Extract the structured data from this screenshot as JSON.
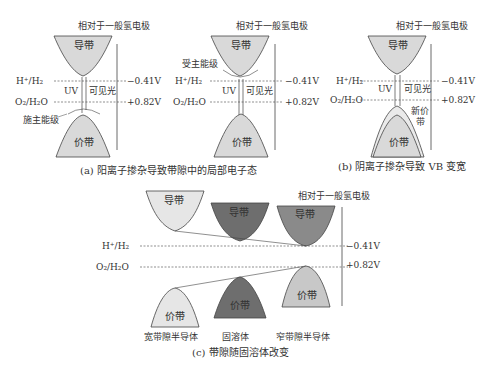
{
  "panel_a": {
    "reference_label": "相对于一般氢电极",
    "conduction_band": "导带",
    "valence_band": "价带",
    "h_label": "H⁺/H₂",
    "o_label": "O₂/H₂O",
    "h_potential": "−0.41V",
    "o_potential": "+0.82V",
    "uv_label": "UV",
    "visible_label": "可见光",
    "level_label": "施主能级"
  },
  "panel_b_mid": {
    "reference_label": "相对于一般氢电极",
    "conduction_band": "导带",
    "valence_band": "价带",
    "h_label": "H⁺/H₂",
    "o_label": "O₂/H₂O",
    "h_potential": "−0.41V",
    "o_potential": "+0.82V",
    "uv_label": "UV",
    "visible_label": "可见光",
    "level_label": "受主能级"
  },
  "caption_a": "(a) 阳离子掺杂导致带隙中的局部电子态",
  "panel_b": {
    "reference_label": "相对于一般氢电极",
    "conduction_band": "导带",
    "valence_band": "价带",
    "h_label": "H⁺/H₂",
    "o_label": "O₂/H₂O",
    "h_potential": "−0.41V",
    "o_potential": "+0.82V",
    "uv_label": "UV",
    "visible_label": "可见光",
    "new_vb_line1": "新价",
    "new_vb_line2": "带"
  },
  "caption_b": "(b) 阴离子掺杂导致 VB 变宽",
  "panel_c": {
    "reference_label": "相对于一般氢电极",
    "h_label": "H⁺/H₂",
    "o_label": "O₂/H₂O",
    "h_potential": "−0.41V",
    "o_potential": "+0.82V",
    "bands": [
      {
        "cb": "导带",
        "vb": "价带",
        "name": "宽带隙半导体"
      },
      {
        "cb": "导带",
        "vb": "价带",
        "name": "固溶体"
      },
      {
        "cb": "导带",
        "vb": "价带",
        "name": "窄带隙半导体"
      }
    ],
    "caption": "(c) 带隙随固溶体改变"
  },
  "colors": {
    "light_fill": "#d9d9d9",
    "dark_fill": "#6e6e6e",
    "mid_fill": "#c8c8c8",
    "stroke": "#444444"
  }
}
